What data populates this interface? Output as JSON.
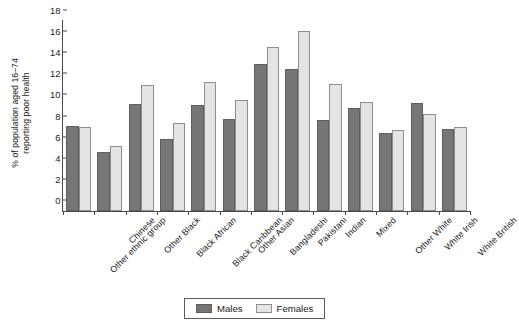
{
  "chart_data": {
    "type": "bar",
    "title": "",
    "subtitle": "",
    "xlabel": "",
    "ylabel": "% of population aged 16–74\nreporting poor health",
    "ylim": [
      0,
      18
    ],
    "yticks": [
      0,
      2,
      4,
      6,
      8,
      10,
      12,
      14,
      16,
      18
    ],
    "grid": false,
    "legend_position": "bottom-center",
    "categories": [
      "Other ethnic group",
      "Chinese",
      "Other Black",
      "Black African",
      "Black Caribbean",
      "Other Asian",
      "Bangladeshi",
      "Pakistani",
      "Indian",
      "Mixed",
      "Other White",
      "White Irish",
      "White British"
    ],
    "series": [
      {
        "name": "Males",
        "color": "#767676",
        "values": [
          8.1,
          5.6,
          10.1,
          6.8,
          10.0,
          8.7,
          13.9,
          13.5,
          8.6,
          9.8,
          7.4,
          10.2,
          7.8
        ]
      },
      {
        "name": "Females",
        "color": "#e4e4e4",
        "values": [
          8.0,
          6.2,
          11.9,
          8.3,
          12.2,
          10.5,
          15.5,
          17.1,
          12.0,
          10.3,
          7.7,
          9.2,
          8.0
        ]
      }
    ]
  },
  "legend": {
    "items": [
      {
        "label": "Males",
        "swatch": "male"
      },
      {
        "label": "Females",
        "swatch": "female"
      }
    ]
  }
}
